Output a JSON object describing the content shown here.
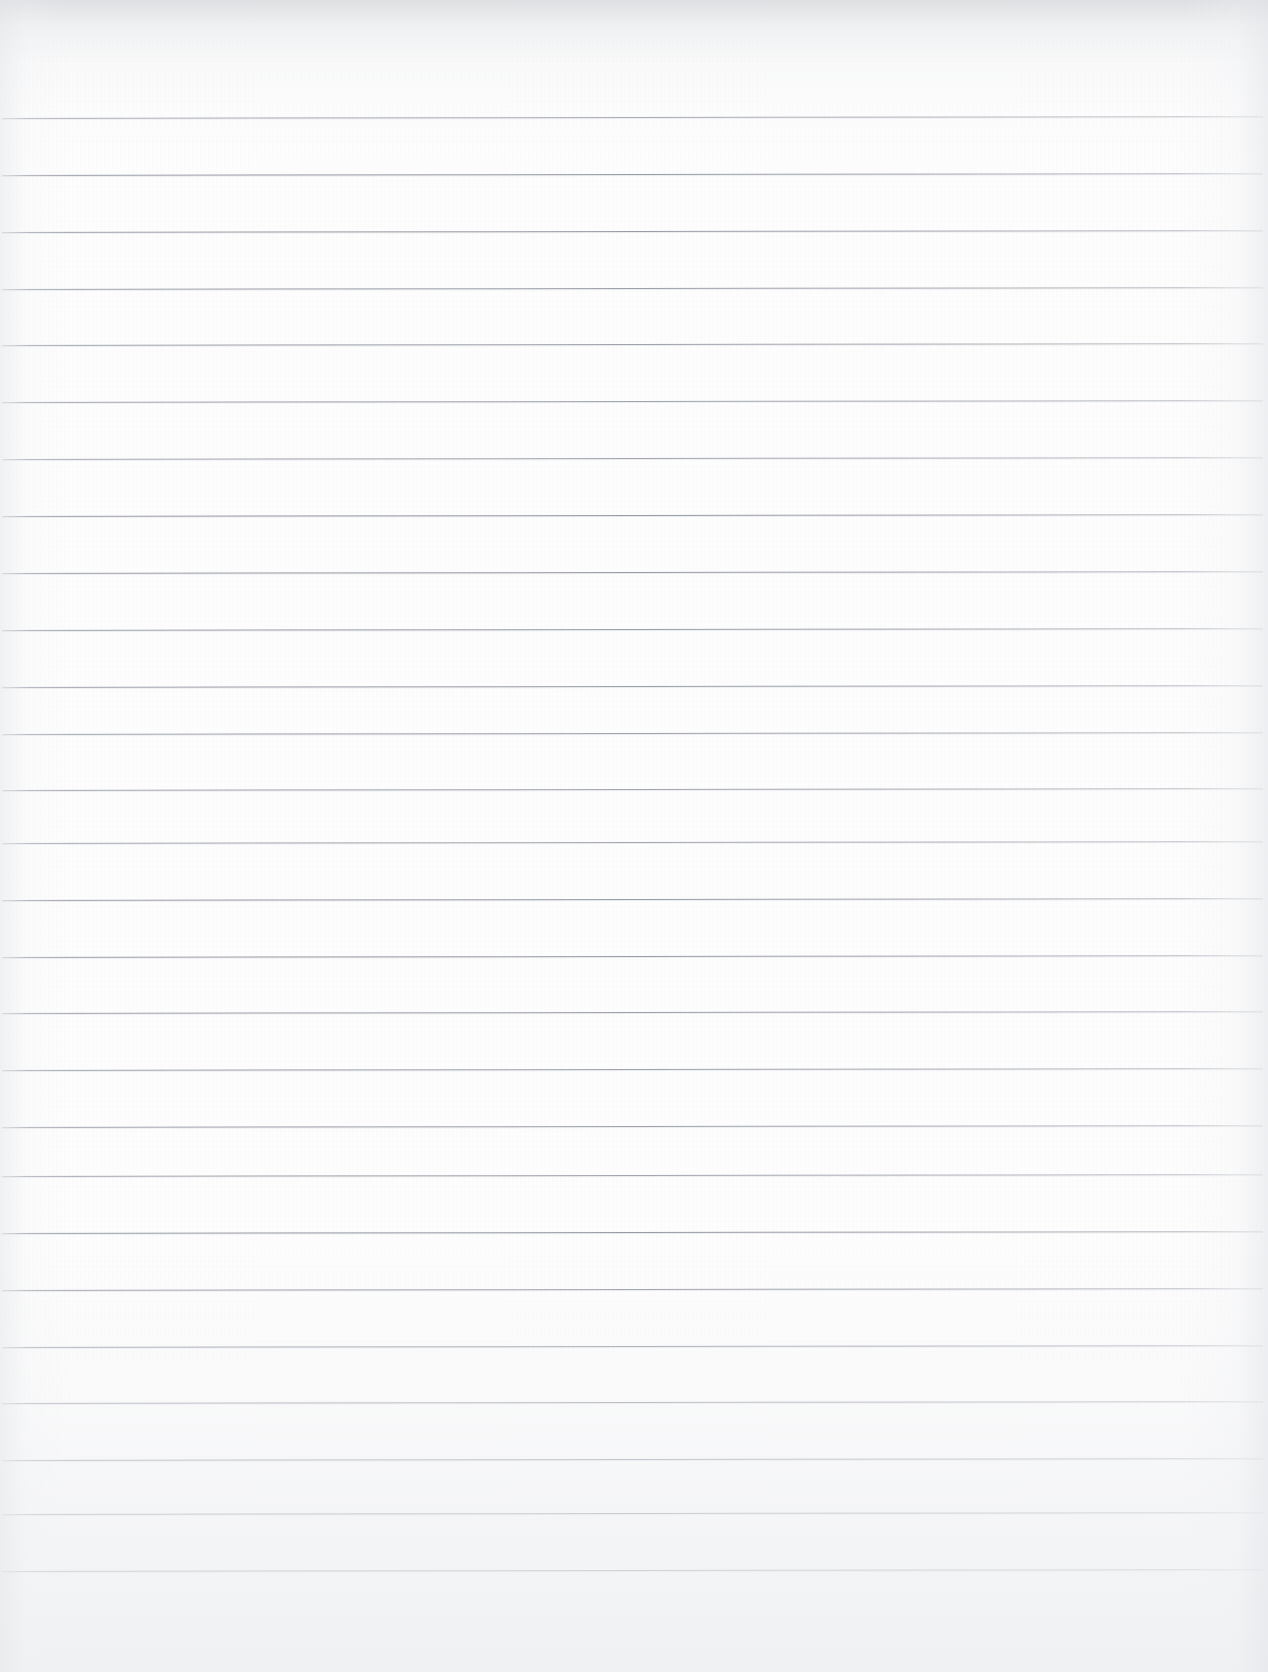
{
  "document": {
    "kind": "scanned-lined-paper",
    "title": "Blank lined notebook page",
    "content_text": "",
    "page_width_px": 1268,
    "page_height_px": 1672,
    "orientation": "portrait",
    "background_color": "#fdfdfd",
    "paper_tone": "#fdfdfd"
  },
  "ruling": {
    "style": "wide-ruled horizontal lines",
    "line_color": "#949aa0",
    "line_thickness_px": 1,
    "line_spacing_px": 56.9,
    "first_line_y_px": 118,
    "last_line_y_px": 1571,
    "line_start_x_px": 2,
    "line_end_x_px": 1263,
    "line_count": 26,
    "margin_rule": "none",
    "skew_deg": -0.09,
    "line_y_positions": [
      118,
      175,
      232,
      289,
      345,
      402,
      459,
      516,
      573,
      630,
      687,
      734,
      790,
      843,
      900,
      957,
      1013,
      1070,
      1127,
      1176,
      1233,
      1290,
      1347,
      1403,
      1460,
      1514,
      1571
    ]
  },
  "shading": {
    "top_shadow_color": "#c4c7cc",
    "bottom_wash_color": "#ebeced",
    "left_edge_color": "#e4e6e9",
    "right_edge_color": "#e2e4e8",
    "texture": "fine paper fiber noise"
  },
  "annotations": {
    "handwriting": "none",
    "marks": "none",
    "text_lines": []
  }
}
